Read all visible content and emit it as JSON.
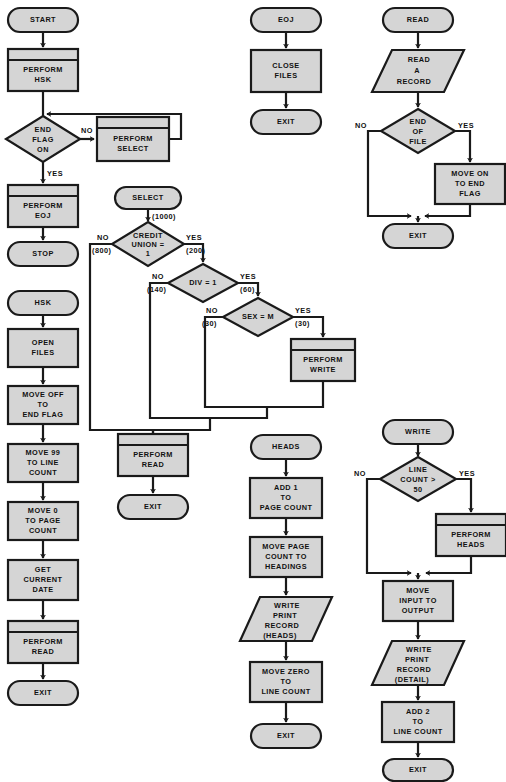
{
  "diagram": {
    "colors": {
      "shape_fill": "#d5d5d5",
      "stroke": "#1a1a1a",
      "background": "#ffffff",
      "text": "#111111"
    },
    "shape_types": {
      "terminator": "rounded-stadium",
      "process": "rectangle",
      "predefined_process": "rectangle-with-top-bar",
      "decision": "diamond",
      "io": "parallelogram"
    }
  },
  "modules": [
    {
      "name": "main-module",
      "entry": "START",
      "nodes": [
        {
          "id": "start",
          "type": "terminator",
          "text": [
            "START"
          ]
        },
        {
          "id": "perform-hsk",
          "type": "predefined_process",
          "text": [
            "PERFORM",
            "HSK"
          ]
        },
        {
          "id": "end-flag-on",
          "type": "decision",
          "text": [
            "END",
            "FLAG",
            "ON"
          ]
        },
        {
          "id": "perform-select",
          "type": "predefined_process",
          "text": [
            "PERFORM",
            "SELECT"
          ]
        },
        {
          "id": "perform-eoj",
          "type": "predefined_process",
          "text": [
            "PERFORM",
            "EOJ"
          ]
        },
        {
          "id": "stop",
          "type": "terminator",
          "text": [
            "STOP"
          ]
        }
      ],
      "branch_labels": [
        {
          "from": "end-flag-on",
          "label": "NO",
          "to": "perform-select"
        },
        {
          "from": "end-flag-on",
          "label": "YES",
          "to": "perform-eoj"
        }
      ]
    },
    {
      "name": "hsk-module",
      "entry": "HSK",
      "nodes": [
        {
          "id": "hsk",
          "type": "terminator",
          "text": [
            "HSK"
          ]
        },
        {
          "id": "open-files",
          "type": "process",
          "text": [
            "OPEN",
            "FILES"
          ]
        },
        {
          "id": "move-off-flag",
          "type": "process",
          "text": [
            "MOVE OFF",
            "TO",
            "END FLAG"
          ]
        },
        {
          "id": "move-99-line",
          "type": "process",
          "text": [
            "MOVE 99",
            "TO LINE",
            "COUNT"
          ]
        },
        {
          "id": "move-0-page",
          "type": "process",
          "text": [
            "MOVE 0",
            "TO PAGE",
            "COUNT"
          ]
        },
        {
          "id": "get-date",
          "type": "process",
          "text": [
            "GET",
            "CURRENT",
            "DATE"
          ]
        },
        {
          "id": "hsk-perf-read",
          "type": "predefined_process",
          "text": [
            "PERFORM",
            "READ"
          ]
        },
        {
          "id": "hsk-exit",
          "type": "terminator",
          "text": [
            "EXIT"
          ]
        }
      ],
      "branch_labels": []
    },
    {
      "name": "select-module",
      "entry": "SELECT",
      "nodes": [
        {
          "id": "select",
          "type": "terminator",
          "text": [
            "SELECT"
          ]
        },
        {
          "id": "credit-union",
          "type": "decision",
          "text": [
            "CREDIT",
            "UNION =",
            "1"
          ]
        },
        {
          "id": "div-1",
          "type": "decision",
          "text": [
            "DIV = 1"
          ]
        },
        {
          "id": "sex-m",
          "type": "decision",
          "text": [
            "SEX = M"
          ]
        },
        {
          "id": "perform-write",
          "type": "predefined_process",
          "text": [
            "PERFORM",
            "WRITE"
          ]
        },
        {
          "id": "sel-perf-read",
          "type": "predefined_process",
          "text": [
            "PERFORM",
            "READ"
          ]
        },
        {
          "id": "sel-exit",
          "type": "terminator",
          "text": [
            "EXIT"
          ]
        }
      ],
      "branch_labels": [
        {
          "from": "select",
          "label": "(1000)",
          "to": "credit-union"
        },
        {
          "from": "credit-union",
          "label": "NO",
          "to": "merge"
        },
        {
          "from": "credit-union",
          "label": "(800)",
          "to": "merge"
        },
        {
          "from": "credit-union",
          "label": "YES",
          "to": "div-1"
        },
        {
          "from": "credit-union",
          "label": "(200)",
          "to": "div-1"
        },
        {
          "from": "div-1",
          "label": "NO",
          "to": "merge"
        },
        {
          "from": "div-1",
          "label": "(140)",
          "to": "merge"
        },
        {
          "from": "div-1",
          "label": "YES",
          "to": "sex-m"
        },
        {
          "from": "div-1",
          "label": "(60)",
          "to": "sex-m"
        },
        {
          "from": "sex-m",
          "label": "NO",
          "to": "merge"
        },
        {
          "from": "sex-m",
          "label": "(30)",
          "to": "merge"
        },
        {
          "from": "sex-m",
          "label": "YES",
          "to": "perform-write"
        },
        {
          "from": "sex-m",
          "label": "(30)",
          "to": "perform-write"
        }
      ]
    },
    {
      "name": "eoj-module",
      "entry": "EOJ",
      "nodes": [
        {
          "id": "eoj",
          "type": "terminator",
          "text": [
            "EOJ"
          ]
        },
        {
          "id": "close-files",
          "type": "process",
          "text": [
            "CLOSE",
            "FILES"
          ]
        },
        {
          "id": "eoj-exit",
          "type": "terminator",
          "text": [
            "EXIT"
          ]
        }
      ],
      "branch_labels": []
    },
    {
      "name": "heads-module",
      "entry": "HEADS",
      "nodes": [
        {
          "id": "heads",
          "type": "terminator",
          "text": [
            "HEADS"
          ]
        },
        {
          "id": "add-1-page",
          "type": "process",
          "text": [
            "ADD 1",
            "TO",
            "PAGE COUNT"
          ]
        },
        {
          "id": "move-page-hd",
          "type": "process",
          "text": [
            "MOVE PAGE",
            "COUNT TO",
            "HEADINGS"
          ]
        },
        {
          "id": "write-heads",
          "type": "io",
          "text": [
            "WRITE",
            "PRINT",
            "RECORD",
            "(HEADS)"
          ]
        },
        {
          "id": "move-zero-ln",
          "type": "process",
          "text": [
            "MOVE ZERO",
            "TO",
            "LINE COUNT"
          ]
        },
        {
          "id": "heads-exit",
          "type": "terminator",
          "text": [
            "EXIT"
          ]
        }
      ],
      "branch_labels": []
    },
    {
      "name": "read-module",
      "entry": "READ",
      "nodes": [
        {
          "id": "read",
          "type": "terminator",
          "text": [
            "READ"
          ]
        },
        {
          "id": "read-record",
          "type": "io",
          "text": [
            "READ",
            "A",
            "RECORD"
          ]
        },
        {
          "id": "end-of-file",
          "type": "decision",
          "text": [
            "END",
            "OF",
            "FILE"
          ]
        },
        {
          "id": "move-on-flag",
          "type": "process",
          "text": [
            "MOVE ON",
            "TO END",
            "FLAG"
          ]
        },
        {
          "id": "read-exit",
          "type": "terminator",
          "text": [
            "EXIT"
          ]
        }
      ],
      "branch_labels": [
        {
          "from": "end-of-file",
          "label": "NO",
          "to": "read-exit"
        },
        {
          "from": "end-of-file",
          "label": "YES",
          "to": "move-on-flag"
        }
      ]
    },
    {
      "name": "write-module",
      "entry": "WRITE",
      "nodes": [
        {
          "id": "write",
          "type": "terminator",
          "text": [
            "WRITE"
          ]
        },
        {
          "id": "line-count-50",
          "type": "decision",
          "text": [
            "LINE",
            "COUNT >",
            "50"
          ]
        },
        {
          "id": "perform-heads",
          "type": "predefined_process",
          "text": [
            "PERFORM",
            "HEADS"
          ]
        },
        {
          "id": "move-in-out",
          "type": "process",
          "text": [
            "MOVE",
            "INPUT TO",
            "OUTPUT"
          ]
        },
        {
          "id": "write-detail",
          "type": "io",
          "text": [
            "WRITE",
            "PRINT",
            "RECORD",
            "(DETAIL)"
          ]
        },
        {
          "id": "add-2-line",
          "type": "process",
          "text": [
            "ADD 2",
            "TO",
            "LINE COUNT"
          ]
        },
        {
          "id": "write-exit",
          "type": "terminator",
          "text": [
            "EXIT"
          ]
        }
      ],
      "branch_labels": [
        {
          "from": "line-count-50",
          "label": "NO",
          "to": "move-in-out"
        },
        {
          "from": "line-count-50",
          "label": "YES",
          "to": "perform-heads"
        }
      ]
    }
  ],
  "layout": {
    "nodes": {
      "start": {
        "cx": 43,
        "cy": 20,
        "w": 70,
        "h": 24
      },
      "perform-hsk": {
        "cx": 43,
        "cy": 70,
        "w": 70,
        "h": 42
      },
      "end-flag-on": {
        "cx": 43,
        "cy": 139,
        "w": 74,
        "h": 46
      },
      "perform-select": {
        "cx": 133,
        "cy": 139,
        "w": 72,
        "h": 44
      },
      "perform-eoj": {
        "cx": 43,
        "cy": 205,
        "w": 70,
        "h": 42
      },
      "stop": {
        "cx": 43,
        "cy": 252,
        "w": 70,
        "h": 24
      },
      "hsk": {
        "cx": 43,
        "cy": 303,
        "w": 70,
        "h": 24
      },
      "open-files": {
        "cx": 43,
        "cy": 348,
        "w": 70,
        "h": 38
      },
      "move-off-flag": {
        "cx": 43,
        "cy": 405,
        "w": 70,
        "h": 38
      },
      "move-99-line": {
        "cx": 43,
        "cy": 463,
        "w": 70,
        "h": 38
      },
      "move-0-page": {
        "cx": 43,
        "cy": 521,
        "w": 70,
        "h": 38
      },
      "get-date": {
        "cx": 43,
        "cy": 580,
        "w": 70,
        "h": 40
      },
      "hsk-perf-read": {
        "cx": 43,
        "cy": 642,
        "w": 70,
        "h": 42
      },
      "hsk-exit": {
        "cx": 43,
        "cy": 692,
        "w": 70,
        "h": 24
      },
      "select": {
        "cx": 148,
        "cy": 198,
        "w": 66,
        "h": 22
      },
      "credit-union": {
        "cx": 148,
        "cy": 244,
        "w": 72,
        "h": 44
      },
      "div-1": {
        "cx": 203,
        "cy": 283,
        "w": 70,
        "h": 38
      },
      "sex-m": {
        "cx": 258,
        "cy": 317,
        "w": 70,
        "h": 38
      },
      "perform-write": {
        "cx": 323,
        "cy": 360,
        "w": 64,
        "h": 42
      },
      "sel-perf-read": {
        "cx": 153,
        "cy": 455,
        "w": 70,
        "h": 42
      },
      "sel-exit": {
        "cx": 153,
        "cy": 506,
        "w": 70,
        "h": 24
      },
      "eoj": {
        "cx": 286,
        "cy": 20,
        "w": 70,
        "h": 24
      },
      "close-files": {
        "cx": 286,
        "cy": 71,
        "w": 70,
        "h": 42
      },
      "eoj-exit": {
        "cx": 286,
        "cy": 121,
        "w": 70,
        "h": 24
      },
      "heads": {
        "cx": 286,
        "cy": 447,
        "w": 70,
        "h": 24
      },
      "add-1-page": {
        "cx": 286,
        "cy": 498,
        "w": 72,
        "h": 40
      },
      "move-page-hd": {
        "cx": 286,
        "cy": 557,
        "w": 72,
        "h": 40
      },
      "write-heads": {
        "cx": 286,
        "cy": 619,
        "w": 72,
        "h": 44
      },
      "move-zero-ln": {
        "cx": 286,
        "cy": 682,
        "w": 72,
        "h": 40
      },
      "heads-exit": {
        "cx": 286,
        "cy": 735,
        "w": 70,
        "h": 24
      },
      "read": {
        "cx": 418,
        "cy": 20,
        "w": 70,
        "h": 24
      },
      "read-record": {
        "cx": 418,
        "cy": 71,
        "w": 72,
        "h": 42
      },
      "end-of-file": {
        "cx": 418,
        "cy": 131,
        "w": 74,
        "h": 44
      },
      "move-on-flag": {
        "cx": 458,
        "cy": 184,
        "w": 70,
        "h": 40
      },
      "read-exit": {
        "cx": 418,
        "cy": 233,
        "w": 70,
        "h": 24
      },
      "write": {
        "cx": 418,
        "cy": 432,
        "w": 70,
        "h": 24
      },
      "line-count-50": {
        "cx": 418,
        "cy": 479,
        "w": 76,
        "h": 44
      },
      "perform-heads": {
        "cx": 458,
        "cy": 535,
        "w": 70,
        "h": 42
      },
      "move-in-out": {
        "cx": 418,
        "cy": 600,
        "w": 70,
        "h": 40
      },
      "write-detail": {
        "cx": 418,
        "cy": 662,
        "w": 72,
        "h": 44
      },
      "add-2-line": {
        "cx": 418,
        "cy": 722,
        "w": 72,
        "h": 40
      },
      "write-exit": {
        "cx": 418,
        "cy": 770,
        "w": 70,
        "h": 22
      }
    }
  }
}
